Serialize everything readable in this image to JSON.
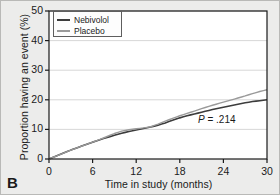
{
  "panel": {
    "label": "B"
  },
  "legend": {
    "position": "top-left",
    "entries": [
      {
        "label": "Nebivolol",
        "color": "#3c3c3c"
      },
      {
        "label": "Placebo",
        "color": "#9a9a9a"
      }
    ]
  },
  "annotation": {
    "p_symbol": "P",
    "p_text": " = .214",
    "full": "P = .214"
  },
  "axes": {
    "y_title": "Proportion having an event (%)",
    "x_title": "Time in study (months)",
    "y_ticks": [
      "0",
      "10",
      "20",
      "30",
      "40",
      "50"
    ],
    "x_ticks": [
      "0",
      "6",
      "12",
      "18",
      "24",
      "30"
    ]
  },
  "colors": {
    "nebivolol": "#3c3c3c",
    "placebo": "#9a9a9a",
    "axis": "#1a1a1a",
    "grid": "#d2d2d2",
    "background": "#ececeb",
    "plot_background": "#ffffff"
  },
  "chart_data": {
    "type": "line",
    "title": "",
    "subtitle": "",
    "xlabel": "Time in study (months)",
    "ylabel": "Proportion having an event (%)",
    "xlim": [
      0,
      30
    ],
    "ylim": [
      0,
      50
    ],
    "xticks": [
      0,
      6,
      12,
      18,
      24,
      30
    ],
    "yticks": [
      0,
      10,
      20,
      30,
      40,
      50
    ],
    "grid": "horizontal",
    "legend_position": "top-left",
    "annotations": [
      {
        "text": "P = .214",
        "x": 24.0,
        "y": 13.0
      },
      {
        "text": "B",
        "x": -2.0,
        "y": -8.0
      }
    ],
    "series": [
      {
        "name": "Nebivolol",
        "color": "#3c3c3c",
        "x": [
          0,
          1,
          2,
          3,
          4,
          5,
          6,
          7,
          8,
          9,
          10,
          11,
          12,
          13,
          14,
          15,
          16,
          17,
          18,
          19,
          20,
          21,
          22,
          23,
          24,
          25,
          26,
          27,
          28,
          29,
          30
        ],
        "values": [
          0.0,
          1.0,
          2.0,
          3.0,
          3.9,
          4.8,
          5.7,
          6.5,
          7.3,
          8.0,
          8.7,
          9.3,
          9.8,
          10.3,
          10.8,
          11.4,
          12.2,
          13.1,
          13.9,
          14.6,
          15.2,
          15.8,
          16.4,
          17.0,
          17.5,
          18.0,
          18.5,
          19.0,
          19.4,
          19.7,
          20.0
        ]
      },
      {
        "name": "Placebo",
        "color": "#9a9a9a",
        "x": [
          0,
          1,
          2,
          3,
          4,
          5,
          6,
          7,
          8,
          9,
          10,
          11,
          12,
          13,
          14,
          15,
          16,
          17,
          18,
          19,
          20,
          21,
          22,
          23,
          24,
          25,
          26,
          27,
          28,
          29,
          30
        ],
        "values": [
          0.0,
          1.0,
          2.0,
          3.0,
          3.9,
          4.8,
          5.7,
          6.6,
          7.6,
          8.6,
          9.4,
          9.9,
          10.2,
          10.5,
          10.9,
          11.8,
          12.8,
          13.7,
          14.6,
          15.4,
          16.2,
          17.0,
          17.8,
          18.5,
          19.2,
          19.9,
          20.6,
          21.3,
          22.1,
          22.8,
          23.4
        ]
      }
    ]
  }
}
